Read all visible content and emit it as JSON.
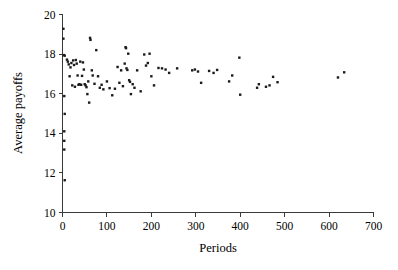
{
  "figure": {
    "background_color": "#ffffff",
    "point_color": "#1b1b1b",
    "axis_color": "#3a3a3a"
  },
  "chart_data": {
    "type": "scatter",
    "title": "",
    "subtitle": "",
    "xlabel": "Periods",
    "ylabel": "Average payoffs",
    "xlim": [
      0,
      700
    ],
    "ylim": [
      10,
      20
    ],
    "xticks": [
      0,
      100,
      200,
      300,
      400,
      500,
      600,
      700
    ],
    "xtick_labels": [
      "0",
      "100",
      "200",
      "300",
      "400",
      "500",
      "600",
      "700"
    ],
    "yticks": [
      10,
      12,
      14,
      16,
      18,
      20
    ],
    "ytick_labels": [
      "10",
      "12",
      "14",
      "16",
      "18",
      "20"
    ],
    "grid": false,
    "legend": null,
    "marker": "square",
    "marker_size_px": 2.4,
    "series": [
      {
        "name": "Average payoffs by period",
        "points": [
          [
            2,
            19.28
          ],
          [
            2,
            18.78
          ],
          [
            3,
            17.95
          ],
          [
            5,
            17.92
          ],
          [
            4,
            15.88
          ],
          [
            5,
            14.98
          ],
          [
            4,
            14.1
          ],
          [
            4,
            13.62
          ],
          [
            4,
            13.18
          ],
          [
            5,
            11.63
          ],
          [
            10,
            17.72
          ],
          [
            12,
            17.62
          ],
          [
            14,
            17.48
          ],
          [
            16,
            16.88
          ],
          [
            18,
            17.33
          ],
          [
            20,
            17.55
          ],
          [
            22,
            16.42
          ],
          [
            24,
            17.68
          ],
          [
            26,
            17.45
          ],
          [
            28,
            16.35
          ],
          [
            30,
            17.7
          ],
          [
            32,
            17.52
          ],
          [
            34,
            16.92
          ],
          [
            36,
            16.45
          ],
          [
            38,
            16.48
          ],
          [
            40,
            17.62
          ],
          [
            42,
            16.45
          ],
          [
            44,
            16.9
          ],
          [
            46,
            17.58
          ],
          [
            48,
            17.22
          ],
          [
            50,
            16.48
          ],
          [
            52,
            16.42
          ],
          [
            54,
            16.33
          ],
          [
            56,
            15.98
          ],
          [
            58,
            16.62
          ],
          [
            60,
            15.55
          ],
          [
            62,
            18.82
          ],
          [
            63,
            18.72
          ],
          [
            66,
            17.18
          ],
          [
            68,
            16.92
          ],
          [
            72,
            16.5
          ],
          [
            76,
            18.2
          ],
          [
            80,
            16.88
          ],
          [
            84,
            16.3
          ],
          [
            88,
            16.45
          ],
          [
            92,
            16.22
          ],
          [
            100,
            16.62
          ],
          [
            106,
            16.28
          ],
          [
            112,
            15.92
          ],
          [
            118,
            16.25
          ],
          [
            124,
            17.35
          ],
          [
            128,
            16.55
          ],
          [
            132,
            17.18
          ],
          [
            136,
            16.38
          ],
          [
            140,
            17.52
          ],
          [
            142,
            18.35
          ],
          [
            143,
            18.3
          ],
          [
            144,
            17.28
          ],
          [
            146,
            17.2
          ],
          [
            148,
            18.02
          ],
          [
            150,
            16.68
          ],
          [
            152,
            16.6
          ],
          [
            154,
            15.98
          ],
          [
            158,
            16.48
          ],
          [
            162,
            16.3
          ],
          [
            168,
            17.18
          ],
          [
            176,
            16.12
          ],
          [
            184,
            17.98
          ],
          [
            188,
            17.42
          ],
          [
            192,
            17.55
          ],
          [
            196,
            18.02
          ],
          [
            200,
            16.88
          ],
          [
            206,
            16.42
          ],
          [
            216,
            17.3
          ],
          [
            224,
            17.28
          ],
          [
            232,
            17.22
          ],
          [
            240,
            17.05
          ],
          [
            258,
            17.28
          ],
          [
            292,
            17.18
          ],
          [
            298,
            17.22
          ],
          [
            305,
            17.12
          ],
          [
            312,
            16.55
          ],
          [
            330,
            17.15
          ],
          [
            340,
            17.05
          ],
          [
            348,
            17.2
          ],
          [
            375,
            16.62
          ],
          [
            382,
            16.92
          ],
          [
            398,
            17.82
          ],
          [
            400,
            15.95
          ],
          [
            438,
            16.3
          ],
          [
            442,
            16.48
          ],
          [
            458,
            16.35
          ],
          [
            466,
            16.42
          ],
          [
            474,
            16.85
          ],
          [
            484,
            16.58
          ],
          [
            620,
            16.82
          ],
          [
            634,
            17.08
          ]
        ]
      }
    ]
  }
}
